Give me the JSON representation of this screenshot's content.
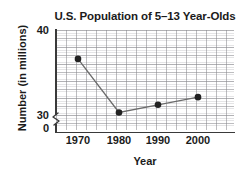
{
  "chart_data": {
    "type": "line",
    "title": "U.S. Population of 5–13 Year-Olds",
    "xlabel": "Year",
    "ylabel": "Number (in millions)",
    "categories": [
      1970,
      1980,
      1990,
      2000
    ],
    "x_tick_labels": [
      "1970",
      "1980",
      "1990",
      "2000"
    ],
    "y_tick_labels": [
      "40",
      "30",
      "0"
    ],
    "y_ticks": [
      40,
      30,
      0
    ],
    "values": [
      36.6,
      30.3,
      31.2,
      32.1
    ],
    "series": [
      {
        "name": "U.S. Population of 5-13 Year-Olds",
        "values": [
          36.6,
          30.3,
          31.2,
          32.1
        ]
      }
    ],
    "ylim": [
      30,
      40
    ],
    "xlim": [
      1965,
      2005
    ],
    "y_axis_break": true,
    "y_axis_break_label": "0",
    "grid": true,
    "grid_major_spacing_y": 1,
    "grid_minor": true,
    "legend": "none",
    "marker": "filled-circle",
    "line_color": "#6b6b6b",
    "marker_color": "#222222",
    "grid_color": "#8a8a8f",
    "axis_color": "#3a3a3a",
    "text_color": "#1b1b1b",
    "background": "#ffffff"
  },
  "axis": {
    "y_tick_40": "40",
    "y_tick_30": "30",
    "y_tick_zero": "0",
    "x_tick_1970": "1970",
    "x_tick_1980": "1980",
    "x_tick_1990": "1990",
    "x_tick_2000": "2000"
  }
}
